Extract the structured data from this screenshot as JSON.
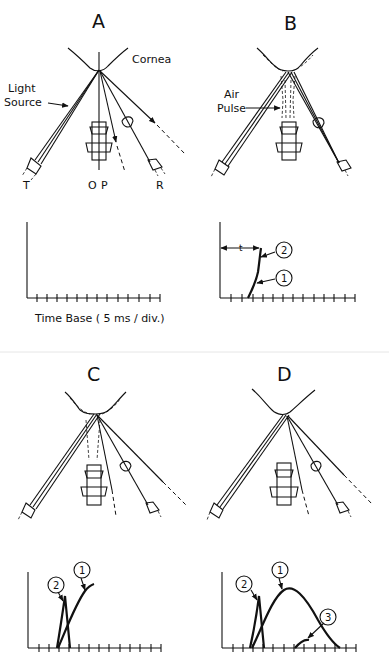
{
  "figure": {
    "divider_color": "#e6e6e6",
    "panels": [
      {
        "id": "A",
        "letter": "A",
        "labels": {
          "cornea": "Cornea",
          "light_source_1": "Light",
          "light_source_2": "Source",
          "transmitter": "T",
          "objective": "O",
          "pulse": "P",
          "receiver": "R"
        },
        "graph": {
          "x_axis_label": "Time Base ( 5 ms / div.)",
          "ticks": 12,
          "curves": []
        }
      },
      {
        "id": "B",
        "letter": "B",
        "labels": {
          "air_pulse_1": "Air",
          "air_pulse_2": "Pulse"
        },
        "graph": {
          "ticks": 12,
          "interval_marker": "t",
          "curves": [
            {
              "id": "1",
              "label": "1"
            },
            {
              "id": "2",
              "label": "2"
            }
          ]
        }
      },
      {
        "id": "C",
        "letter": "C",
        "graph": {
          "ticks": 12,
          "curves": [
            {
              "id": "1",
              "label": "1"
            },
            {
              "id": "2",
              "label": "2"
            }
          ]
        }
      },
      {
        "id": "D",
        "letter": "D",
        "graph": {
          "ticks": 12,
          "curves": [
            {
              "id": "1",
              "label": "1"
            },
            {
              "id": "2",
              "label": "2"
            },
            {
              "id": "3",
              "label": "3"
            }
          ]
        }
      }
    ]
  }
}
